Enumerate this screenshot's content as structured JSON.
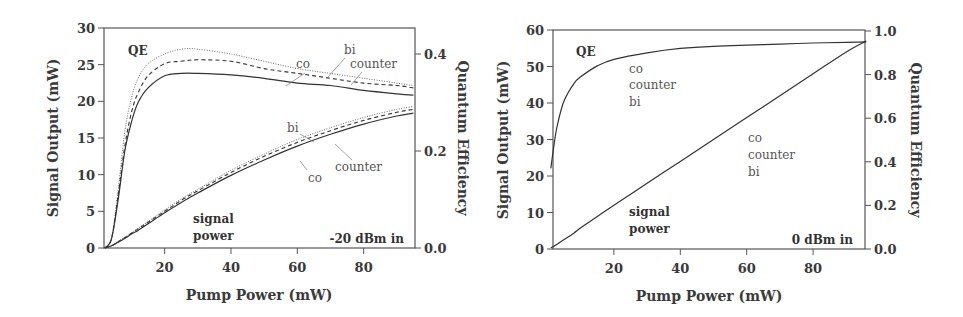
{
  "chart_data": [
    {
      "type": "line",
      "title": "",
      "annotation": "-20 dBm in",
      "xlabel": "Pump Power (mW)",
      "ylabel": "Signal Output (mW)",
      "ylabel_right": "Quantum Efficiency",
      "xlim": [
        2,
        96
      ],
      "ylim": [
        0,
        30
      ],
      "ylim_right": [
        0,
        0.45
      ],
      "xticks": [
        "20",
        "40",
        "60",
        "80"
      ],
      "yticks": [
        "0",
        "5",
        "10",
        "15",
        "20",
        "25",
        "30"
      ],
      "yticks_right": [
        "0.0",
        "0.2",
        "0.4"
      ],
      "grid": false,
      "labels": {
        "qe": "QE",
        "signal_power_line1": "signal",
        "signal_power_line2": "power",
        "qe_co": "co",
        "qe_bi": "bi",
        "qe_counter": "counter",
        "sig_bi": "bi",
        "sig_counter": "counter",
        "sig_co": "co"
      },
      "x": [
        2,
        4,
        6,
        8,
        10,
        12,
        15,
        20,
        25,
        30,
        40,
        50,
        60,
        70,
        80,
        90,
        95
      ],
      "series": [
        {
          "name": "QE bi (dotted)",
          "axis": "right",
          "style": "dotted",
          "values": [
            0.0,
            0.02,
            0.12,
            0.24,
            0.31,
            0.35,
            0.38,
            0.4,
            0.41,
            0.41,
            0.4,
            0.385,
            0.37,
            0.36,
            0.35,
            0.34,
            0.335
          ]
        },
        {
          "name": "QE counter (dashed)",
          "axis": "right",
          "style": "dashed",
          "values": [
            0.0,
            0.02,
            0.11,
            0.21,
            0.28,
            0.32,
            0.355,
            0.38,
            0.385,
            0.388,
            0.385,
            0.37,
            0.36,
            0.35,
            0.34,
            0.335,
            0.33
          ]
        },
        {
          "name": "QE co (solid)",
          "axis": "right",
          "style": "solid",
          "values": [
            0.0,
            0.02,
            0.1,
            0.2,
            0.26,
            0.3,
            0.33,
            0.355,
            0.36,
            0.36,
            0.357,
            0.35,
            0.34,
            0.335,
            0.325,
            0.318,
            0.315
          ]
        },
        {
          "name": "Signal bi (dotted)",
          "axis": "left",
          "style": "dotted",
          "values": [
            0.0,
            0.3,
            0.9,
            1.5,
            2.1,
            2.7,
            3.6,
            5.2,
            6.7,
            8.0,
            10.6,
            12.8,
            14.8,
            16.4,
            17.8,
            18.9,
            19.3
          ]
        },
        {
          "name": "Signal counter (dashed)",
          "axis": "left",
          "style": "dashed",
          "values": [
            0.0,
            0.3,
            0.85,
            1.4,
            2.0,
            2.6,
            3.5,
            5.0,
            6.5,
            7.8,
            10.3,
            12.5,
            14.4,
            16.0,
            17.4,
            18.5,
            18.9
          ]
        },
        {
          "name": "Signal co (solid)",
          "axis": "left",
          "style": "solid",
          "values": [
            0.0,
            0.3,
            0.8,
            1.3,
            1.9,
            2.4,
            3.3,
            4.8,
            6.2,
            7.5,
            9.9,
            12.0,
            13.9,
            15.5,
            16.9,
            18.0,
            18.4
          ]
        }
      ]
    },
    {
      "type": "line",
      "title": "",
      "annotation": "0 dBm in",
      "xlabel": "Pump Power (mW)",
      "ylabel": "Signal Output (mW)",
      "ylabel_right": "Quantum Efficiency",
      "xlim": [
        1,
        96
      ],
      "ylim": [
        0,
        60
      ],
      "ylim_right": [
        0,
        1.0
      ],
      "xticks": [
        "20",
        "40",
        "60",
        "80"
      ],
      "yticks": [
        "0",
        "10",
        "20",
        "30",
        "40",
        "50",
        "60"
      ],
      "yticks_right": [
        "0.0",
        "0.2",
        "0.4",
        "0.6",
        "0.8",
        "1.0"
      ],
      "grid": false,
      "labels": {
        "qe": "QE",
        "qe_co": "co",
        "qe_counter": "counter",
        "qe_bi": "bi",
        "signal_power_line1": "signal",
        "signal_power_line2": "power",
        "sig_co": "co",
        "sig_counter": "counter",
        "sig_bi": "bi"
      },
      "x": [
        1,
        2,
        3,
        5,
        8,
        10,
        15,
        20,
        30,
        40,
        50,
        60,
        70,
        80,
        90,
        96
      ],
      "series": [
        {
          "name": "QE co/counter/bi (overlapping)",
          "axis": "right",
          "style": "solid",
          "values": [
            0.37,
            0.48,
            0.57,
            0.68,
            0.76,
            0.79,
            0.84,
            0.87,
            0.9,
            0.92,
            0.93,
            0.935,
            0.94,
            0.945,
            0.948,
            0.95
          ]
        },
        {
          "name": "Signal power co/counter/bi (overlapping)",
          "axis": "left",
          "style": "solid",
          "values": [
            0.3,
            0.8,
            1.4,
            2.6,
            4.4,
            5.8,
            8.9,
            12.0,
            18.0,
            24.0,
            30.0,
            36.0,
            42.0,
            48.0,
            54.0,
            57.0
          ]
        }
      ]
    }
  ]
}
